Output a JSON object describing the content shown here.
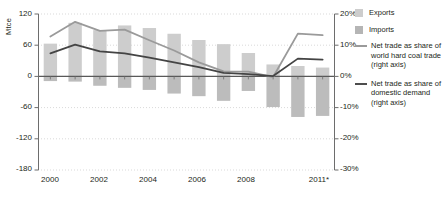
{
  "axis": {
    "left_title": "Mtce",
    "left_ticks": [
      "120",
      "60",
      "0",
      "-60",
      "-120",
      "-180"
    ],
    "right_ticks": [
      "20%",
      "10%",
      "0%",
      "-10%",
      "-20%",
      "-30%"
    ],
    "bottom_ticks": [
      "2000",
      "2002",
      "2004",
      "2006",
      "2008",
      "2011*"
    ]
  },
  "legend": {
    "items": [
      {
        "kind": "swatch",
        "label": "Exports",
        "color": "#cdcdcd"
      },
      {
        "kind": "swatch",
        "label": "Imports",
        "color": "#b5b5b5"
      },
      {
        "kind": "line",
        "label": "Net trade as share of world hard coal trade (right axis)",
        "color": "#9a9a9a"
      },
      {
        "kind": "line",
        "label": "Net trade as share of domestic demand (right axis)",
        "color": "#4d4d4d"
      }
    ]
  },
  "colors": {
    "exports_bar": "#cdcdcd",
    "imports_bar": "#bcbcbc",
    "line_world_trade": "#9a9a9a",
    "line_domestic_demand": "#444444",
    "axis": "#6d6d6d",
    "grid": "#cfcfcf",
    "zero_line": "#595959"
  },
  "chart_data": {
    "type": "bar",
    "title": "",
    "xlabel": "",
    "ylabel": "Mtce",
    "categories": [
      "2000",
      "2001",
      "2002",
      "2003",
      "2004",
      "2005",
      "2006",
      "2007",
      "2008",
      "2009",
      "2010",
      "2011*"
    ],
    "ylim": [
      -180,
      120
    ],
    "ylim_right": [
      -30,
      20
    ],
    "ytick_step": 60,
    "ytick_step_right": 10,
    "grid": true,
    "legend_position": "right",
    "series": [
      {
        "name": "Exports",
        "type": "bar",
        "axis": "left",
        "unit": "Mtce",
        "values": [
          63,
          103,
          89,
          98,
          93,
          82,
          70,
          62,
          45,
          23,
          20,
          17
        ]
      },
      {
        "name": "Imports",
        "type": "bar",
        "axis": "left",
        "unit": "Mtce",
        "values": [
          -9,
          -10,
          -18,
          -22,
          -26,
          -33,
          -38,
          -47,
          -28,
          -59,
          -78,
          -76
        ]
      },
      {
        "name": "Net trade as share of world hard coal trade (right axis)",
        "type": "line",
        "axis": "right",
        "unit": "%",
        "values": [
          12.8,
          17.5,
          14.6,
          15.0,
          11.6,
          8.3,
          4.5,
          1.6,
          1.5,
          -0.2,
          13.7,
          13.2
        ]
      },
      {
        "name": "Net trade as share of domestic demand (right axis)",
        "type": "line",
        "axis": "right",
        "unit": "%",
        "values": [
          7.4,
          10.2,
          8.0,
          7.4,
          6.0,
          4.5,
          3.0,
          1.1,
          0.7,
          0.1,
          5.7,
          5.4
        ]
      }
    ]
  }
}
